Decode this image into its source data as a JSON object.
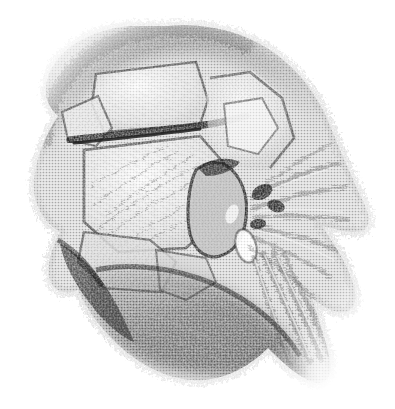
{
  "image": {
    "kind": "scanned-halftone-engraving",
    "subject": "anatomical dissection of the skull base and temporal region",
    "style": "stippled / halftone-dot monochrome engraving",
    "width": 395,
    "height": 409,
    "background_color": "#ffffff",
    "ink_color": "#2b2b2b",
    "midtone_color": "#8a8a8a",
    "highlight_color": "#f2f2f2",
    "has_text_labels": false,
    "has_border": false,
    "caption": ""
  },
  "composition": {
    "subject_bounds": {
      "x": 30,
      "y": 22,
      "width": 340,
      "height": 360
    },
    "light_direction": "upper-left highlights, lower-right shadow",
    "notes": "single centered specimen floating on plain white page, edges fade to stipple"
  },
  "regions": [
    {
      "name": "superior-cranial-shadow-arc",
      "label": "soft dark contour arc along the upper-left vault",
      "tone": "dark",
      "approx_center": [
        120,
        60
      ]
    },
    {
      "name": "upper-bone-plate",
      "label": "pale quadrilateral bone plate at top (parietal / squamous region)",
      "tone": "light",
      "approx_center": [
        140,
        95
      ]
    },
    {
      "name": "sutural-line-upper",
      "label": "heavy dark suture separating upper and middle plates",
      "tone": "darkest",
      "approx_center": [
        150,
        130
      ]
    },
    {
      "name": "large-central-plate",
      "label": "broad pale bone surface with fine radiating striations",
      "tone": "light",
      "approx_center": [
        150,
        200
      ]
    },
    {
      "name": "right-upper-plate",
      "label": "secondary pale plate at upper right (frontal / greater wing)",
      "tone": "light",
      "approx_center": [
        240,
        135
      ]
    },
    {
      "name": "petrous-process",
      "label": "protruding wedge-shaped process at centre right",
      "tone": "mid",
      "approx_center": [
        215,
        215
      ]
    },
    {
      "name": "foramen-highlight",
      "label": "small bright aperture below the process",
      "tone": "highlight",
      "approx_center": [
        245,
        245
      ]
    },
    {
      "name": "nerve-fibre-fan",
      "label": "fan of radiating nerve / fibrous strands toward the right margin",
      "tone": "mid",
      "approx_center": [
        290,
        230
      ]
    },
    {
      "name": "descending-strand-bundle",
      "label": "long parallel strands descending to the lower right",
      "tone": "mid",
      "approx_center": [
        300,
        320
      ]
    },
    {
      "name": "inferior-dark-mass",
      "label": "large dark muscular / soft-tissue mass across the lower half",
      "tone": "dark",
      "approx_center": [
        200,
        305
      ]
    },
    {
      "name": "lower-left-shadow-taper",
      "label": "sharp diagonal shadow edge tapering to the lower left",
      "tone": "dark",
      "approx_center": [
        110,
        300
      ]
    },
    {
      "name": "left-margin-stipple",
      "label": "frayed stippled left border of the specimen",
      "tone": "mid",
      "approx_center": [
        55,
        190
      ]
    }
  ]
}
